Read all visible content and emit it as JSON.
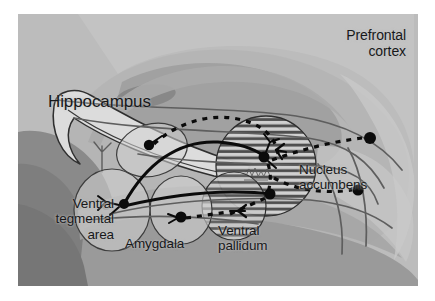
{
  "figure": {
    "frame": {
      "background_color": "#ffffff",
      "image_left": 18,
      "image_top": 14,
      "image_width": 400,
      "image_height": 272
    }
  },
  "labels": {
    "prefrontal_cortex": "Prefrontal\ncortex",
    "hippocampus": "Hippocampus",
    "ventral_tegmental_area": "Ventral\ntegmental\narea",
    "amygdala": "Amygdala",
    "ventral_pallidum": "Ventral\npallidum",
    "nucleus_accumbens": "Nucleus\naccumbens"
  },
  "colors": {
    "image_background": "#b9b9b9",
    "brain_midtone": "#a9a9a9",
    "brain_light": "#c8c8c8",
    "brain_lighter": "#d4d4d4",
    "brain_dark": "#8e8e8e",
    "brain_darker": "#7c7c7c",
    "structure_fill": "#cfcfcf",
    "structure_stroke": "#3a3a3a",
    "hatch_stroke": "#3f3f3f",
    "pathway_solid": "#0a0a0a",
    "pathway_dashed": "#0a0a0a",
    "cortical_fiber": "#5a5a5a",
    "label_text": "#17181a"
  },
  "structures": [
    {
      "name": "hippocampus",
      "shape": "curved-band",
      "fill": "#d6d6d6",
      "stroke": "#3a3a3a",
      "label": "Hippocampus"
    },
    {
      "name": "ventral-tegmental-area",
      "shape": "ellipse",
      "cx": 92,
      "cy": 196,
      "rx": 38,
      "ry": 40,
      "fill": "#cccccc",
      "hatched": false,
      "label": "Ventral tegmental area"
    },
    {
      "name": "amygdala",
      "shape": "ellipse",
      "cx": 163,
      "cy": 196,
      "rx": 31,
      "ry": 34,
      "fill": "#cfcfcf",
      "hatched": false,
      "label": "Amygdala"
    },
    {
      "name": "ventral-pallidum",
      "shape": "ellipse",
      "cx": 218,
      "cy": 192,
      "rx": 32,
      "ry": 34,
      "fill": "#cacaca",
      "hatched": true,
      "label": "Ventral pallidum"
    },
    {
      "name": "nucleus-accumbens",
      "shape": "ellipse",
      "cx": 248,
      "cy": 152,
      "rx": 50,
      "ry": 50,
      "fill": "#d0d0d0",
      "hatched": true,
      "label": "Nucleus accumbens"
    }
  ],
  "pathways": [
    {
      "name": "dopamine-vta-to-nucleus-accumbens",
      "style": "solid",
      "color": "#0a0a0a",
      "origin": "ventral-tegmental-area",
      "target": "nucleus-accumbens"
    },
    {
      "name": "dopamine-vta-to-ventral-pallidum",
      "style": "solid",
      "color": "#0a0a0a",
      "origin": "ventral-tegmental-area",
      "target": "ventral-pallidum"
    },
    {
      "name": "hippocampal-to-nucleus-accumbens",
      "style": "dashed",
      "color": "#0a0a0a",
      "origin": "hippocampus",
      "target": "nucleus-accumbens"
    },
    {
      "name": "amygdala-to-ventral-pallidum",
      "style": "dashed",
      "color": "#0a0a0a",
      "origin": "amygdala",
      "target": "ventral-pallidum"
    },
    {
      "name": "nucleus-accumbens-to-prefrontal-cortex-upper",
      "style": "dashed",
      "color": "#0a0a0a",
      "origin": "nucleus-accumbens",
      "target": "prefrontal-cortex"
    },
    {
      "name": "nucleus-accumbens-to-prefrontal-cortex-lower",
      "style": "dashed",
      "color": "#0a0a0a",
      "origin": "nucleus-accumbens",
      "target": "prefrontal-cortex"
    }
  ],
  "neurons": [
    {
      "name": "neuron-hippocampal",
      "cx": 131,
      "cy": 131,
      "r": 5
    },
    {
      "name": "neuron-vta",
      "cx": 106,
      "cy": 190,
      "r": 5
    },
    {
      "name": "neuron-amygdala",
      "cx": 163,
      "cy": 203,
      "r": 5.5
    },
    {
      "name": "neuron-accumbens-upper",
      "cx": 245,
      "cy": 143,
      "r": 5.5
    },
    {
      "name": "neuron-accumbens-lower",
      "cx": 252,
      "cy": 180,
      "r": 5.5
    },
    {
      "name": "neuron-cortex-upper",
      "cx": 368,
      "cy": 126,
      "r": 6
    },
    {
      "name": "neuron-cortex-lower",
      "cx": 356,
      "cy": 177,
      "r": 5.5
    }
  ]
}
